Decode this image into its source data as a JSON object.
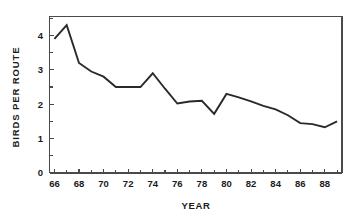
{
  "chart_data": {
    "type": "line",
    "title": "",
    "xlabel": "YEAR",
    "ylabel": "BIRDS PER ROUTE",
    "xlim": [
      65.6,
      89.4
    ],
    "ylim": [
      0,
      4.55
    ],
    "grid": false,
    "legend": "none",
    "x_tick_labels": [
      "66",
      "68",
      "70",
      "72",
      "74",
      "76",
      "78",
      "80",
      "82",
      "84",
      "86",
      "88"
    ],
    "x_tick_values": [
      66,
      68,
      70,
      72,
      74,
      76,
      78,
      80,
      82,
      84,
      86,
      88
    ],
    "x_minor_ticks": [
      67,
      69,
      71,
      73,
      75,
      77,
      79,
      81,
      83,
      85,
      87,
      89
    ],
    "y_tick_labels": [
      "0",
      "1",
      "2",
      "3",
      "4"
    ],
    "y_tick_values": [
      0,
      1,
      2,
      3,
      4
    ],
    "x": [
      66,
      67,
      68,
      69,
      70,
      71,
      72,
      73,
      74,
      75,
      76,
      77,
      78,
      79,
      80,
      81,
      82,
      83,
      84,
      85,
      86,
      87,
      88,
      89
    ],
    "values": [
      3.9,
      4.3,
      3.2,
      2.95,
      2.8,
      2.5,
      2.5,
      2.5,
      2.9,
      2.45,
      2.02,
      2.08,
      2.1,
      1.72,
      2.3,
      2.2,
      2.08,
      1.95,
      1.85,
      1.68,
      1.45,
      1.42,
      1.33,
      1.5
    ],
    "series_name": "Birds per route",
    "line_color": "#2a2a2a",
    "axis_color": "#4a4a4a",
    "background_color": "#ffffff"
  }
}
